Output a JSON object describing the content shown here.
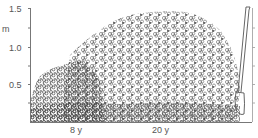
{
  "figure": {
    "type": "cross-section illustration",
    "y_axis": {
      "unit_label": "m",
      "ticks": [
        "1.5",
        "1.0",
        "0.5"
      ]
    },
    "regions": [
      {
        "label": "8 y"
      },
      {
        "label": "20 y"
      }
    ],
    "colors": {
      "line": "#555555",
      "foliage": "#666666",
      "background": "#ffffff"
    }
  }
}
